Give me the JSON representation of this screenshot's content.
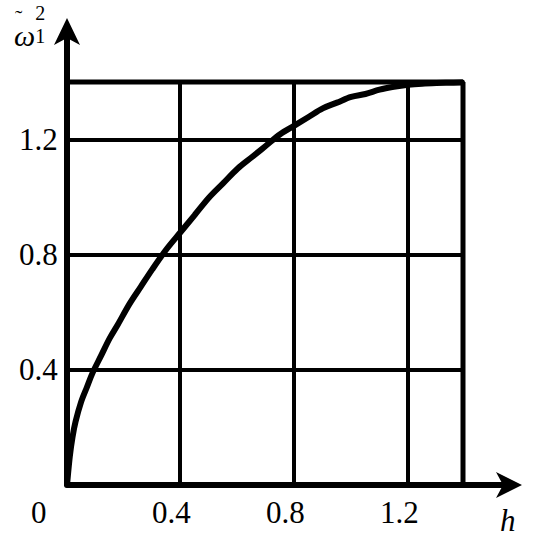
{
  "chart_data": {
    "type": "line",
    "title": "",
    "xlabel": "h",
    "ylabel": "ω̃1²",
    "ylabel_parts": {
      "symbol": "ω",
      "accent": "̃",
      "subscript": "1",
      "superscript": "2"
    },
    "xlim": [
      0,
      1.39
    ],
    "ylim": [
      0,
      1.4
    ],
    "grid": true,
    "legend": null,
    "xticks": [
      0,
      0.4,
      0.8,
      1.2
    ],
    "xtick_labels": [
      "0",
      "0.4",
      "0.8",
      "1.2"
    ],
    "yticks": [
      0.4,
      0.8,
      1.2
    ],
    "ytick_labels": [
      "0.4",
      "0.8",
      "1.2"
    ],
    "gridlines_x": [
      0.4,
      0.8,
      1.2
    ],
    "gridlines_y": [
      0.4,
      0.8,
      1.2,
      1.4
    ],
    "series": [
      {
        "name": "omega1-squared",
        "color": "#000000",
        "x": [
          0.0,
          0.01,
          0.02,
          0.03,
          0.05,
          0.07,
          0.09,
          0.12,
          0.15,
          0.18,
          0.22,
          0.26,
          0.3,
          0.35,
          0.4,
          0.45,
          0.5,
          0.55,
          0.6,
          0.65,
          0.7,
          0.75,
          0.8,
          0.85,
          0.9,
          0.95,
          1.0,
          1.05,
          1.1,
          1.15,
          1.2,
          1.25,
          1.3,
          1.35,
          1.39
        ],
        "y": [
          0.0,
          0.1,
          0.17,
          0.22,
          0.29,
          0.34,
          0.39,
          0.45,
          0.51,
          0.56,
          0.63,
          0.69,
          0.75,
          0.82,
          0.88,
          0.94,
          1.0,
          1.05,
          1.1,
          1.14,
          1.18,
          1.22,
          1.25,
          1.28,
          1.31,
          1.33,
          1.35,
          1.36,
          1.375,
          1.385,
          1.392,
          1.396,
          1.398,
          1.399,
          1.4
        ]
      }
    ],
    "annotations": [
      {
        "text": "curve rises steeply from origin and saturates near 1.4"
      }
    ],
    "axes_style": {
      "arrow_x": true,
      "arrow_y": true,
      "line_color": "#000000",
      "background": "#ffffff"
    }
  },
  "axis": {
    "origin_label": "0",
    "x_name": "h",
    "x_ticks": [
      "0.4",
      "0.8",
      "1.2"
    ],
    "y_ticks": [
      "1.2",
      "0.8",
      "0.4"
    ]
  }
}
